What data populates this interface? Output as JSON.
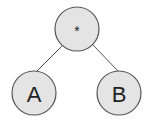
{
  "diagram": {
    "type": "tree",
    "colors": {
      "node_fill": "#e4e4e4",
      "node_stroke": "#555555",
      "edge": "#555555",
      "text": "#222222"
    },
    "nodes": [
      {
        "id": "root",
        "label": "*",
        "cx": 77,
        "cy": 29,
        "r": 22
      },
      {
        "id": "A",
        "label": "A",
        "cx": 34,
        "cy": 93,
        "r": 22
      },
      {
        "id": "B",
        "label": "B",
        "cx": 119,
        "cy": 93,
        "r": 22
      }
    ],
    "edges": [
      {
        "from": "root",
        "to": "A"
      },
      {
        "from": "root",
        "to": "B"
      }
    ]
  }
}
